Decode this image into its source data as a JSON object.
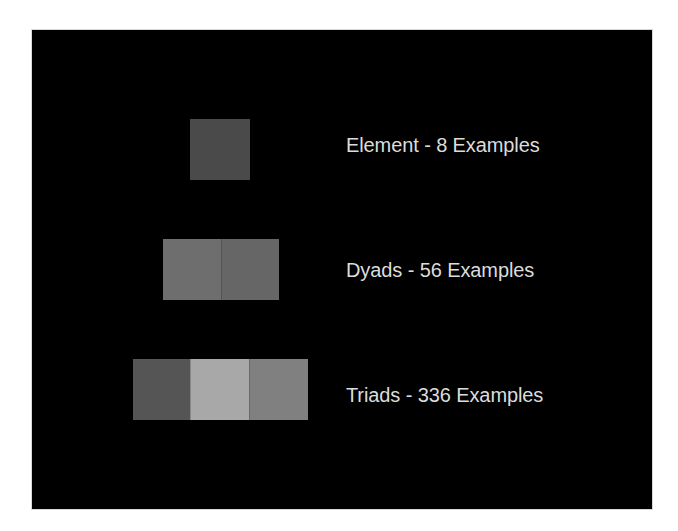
{
  "slide": {
    "background": "#000000",
    "rows": [
      {
        "label": "Element - 8 Examples",
        "swatches": [
          {
            "color": "#4a4a4a"
          }
        ]
      },
      {
        "label": "Dyads - 56 Examples",
        "swatches": [
          {
            "color": "#6e6e6e"
          },
          {
            "color": "#666666"
          }
        ]
      },
      {
        "label": "Triads - 336 Examples",
        "swatches": [
          {
            "color": "#555555"
          },
          {
            "color": "#a8a8a8"
          },
          {
            "color": "#808080"
          }
        ]
      }
    ]
  }
}
